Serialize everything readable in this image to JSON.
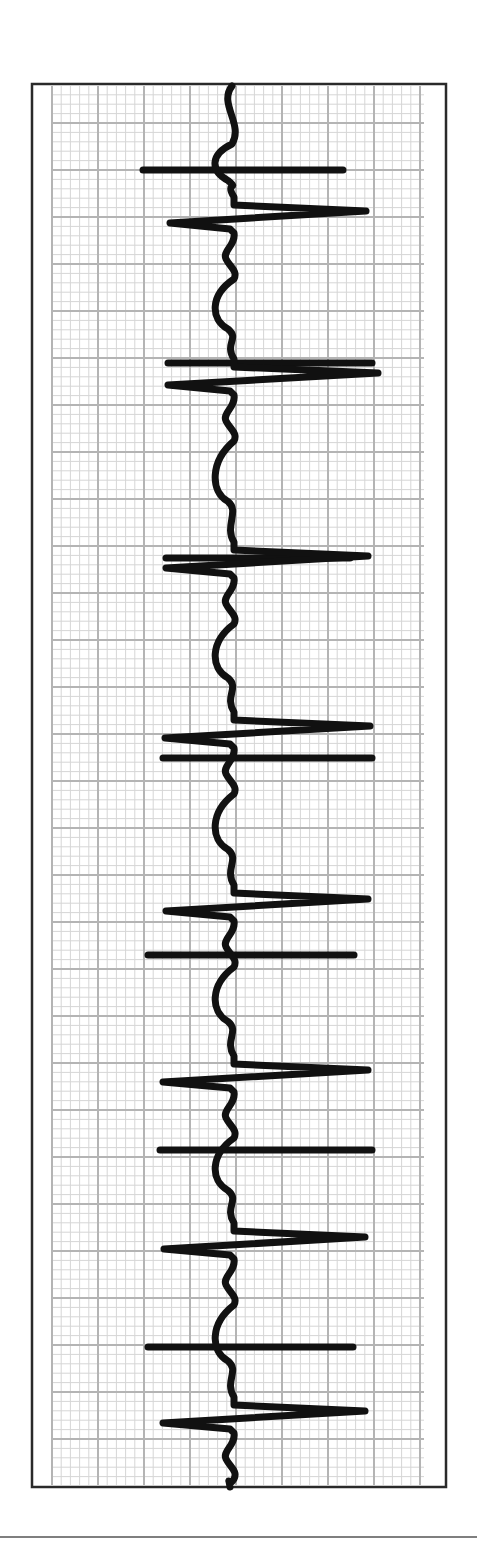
{
  "chart_data": {
    "type": "line",
    "title": "",
    "subtitle": "",
    "xlabel": "",
    "ylabel": "",
    "description": "ECG rhythm strip on standard grid paper, displayed rotated 90 degrees (time runs top to bottom). Eight QRS complexes with horizontal pacing-style marker lines between/overlapping beats.",
    "orientation": "vertical-time",
    "grid": {
      "on": true,
      "major_spacing_px_x": 46,
      "major_spacing_px_y": 47,
      "minor_per_major": 5,
      "major_color": "#b4b4b4",
      "minor_color": "#d6d6d6"
    },
    "frame": {
      "x": 32,
      "y": 84,
      "width": 414,
      "height": 1403,
      "color": "#2a2a2a"
    },
    "grid_area": {
      "x": 52,
      "y": 86,
      "width": 372,
      "height": 1399
    },
    "separator_y": 1537,
    "trace_color": "#111111",
    "trace_width": 7,
    "baseline_x": 232,
    "qrs_complexes": [
      {
        "index": 1,
        "y": 215,
        "r_peak_x": 366,
        "s_trough_x": 170
      },
      {
        "index": 2,
        "y": 377,
        "r_peak_x": 378,
        "s_trough_x": 168
      },
      {
        "index": 3,
        "y": 560,
        "r_peak_x": 368,
        "s_trough_x": 166
      },
      {
        "index": 4,
        "y": 730,
        "r_peak_x": 370,
        "s_trough_x": 165
      },
      {
        "index": 5,
        "y": 903,
        "r_peak_x": 368,
        "s_trough_x": 166
      },
      {
        "index": 6,
        "y": 1074,
        "r_peak_x": 368,
        "s_trough_x": 163
      },
      {
        "index": 7,
        "y": 1241,
        "r_peak_x": 365,
        "s_trough_x": 164
      },
      {
        "index": 8,
        "y": 1415,
        "r_peak_x": 365,
        "s_trough_x": 163
      }
    ],
    "marker_lines": [
      {
        "y": 170,
        "x1": 143,
        "x2": 343
      },
      {
        "y": 363,
        "x1": 168,
        "x2": 372
      },
      {
        "y": 558,
        "x1": 166,
        "x2": 350
      },
      {
        "y": 758,
        "x1": 163,
        "x2": 372
      },
      {
        "y": 955,
        "x1": 148,
        "x2": 354
      },
      {
        "y": 1150,
        "x1": 160,
        "x2": 372
      },
      {
        "y": 1347,
        "x1": 148,
        "x2": 353
      }
    ],
    "rr_interval_px_approx": 171,
    "legend": []
  }
}
